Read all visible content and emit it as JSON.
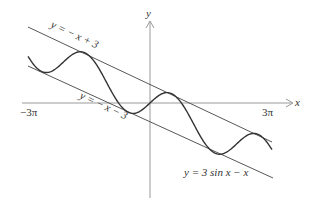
{
  "figure": {
    "axes": {
      "x_label": "x",
      "y_label": "y"
    },
    "ticks": {
      "left": "−3π",
      "right": "3π"
    },
    "labels": {
      "upper_line": "y = − x + 3",
      "lower_line": "y = − x − 3",
      "curve": "y = 3 sin x − x"
    },
    "colors": {
      "curve": "#333333",
      "lines": "#444444",
      "axes": "#999999"
    }
  }
}
